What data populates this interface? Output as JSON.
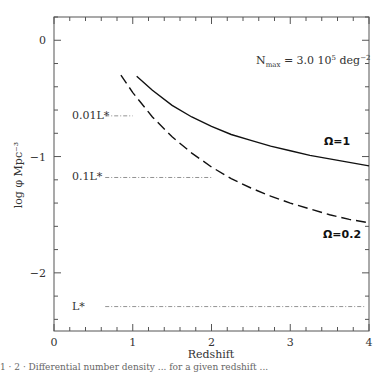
{
  "chart_data": {
    "type": "line",
    "title": "",
    "xlabel": "Redshift",
    "ylabel": "log φ  Mpc⁻³",
    "xlim": [
      0,
      4
    ],
    "ylim": [
      -2.5,
      0.2
    ],
    "x_ticks": [
      0,
      1,
      2,
      3,
      4
    ],
    "x_tick_labels": [
      "0",
      "1",
      "2",
      "3",
      "4"
    ],
    "y_ticks": [
      0,
      -1,
      -2
    ],
    "y_tick_labels": [
      "0",
      "−1",
      "−2"
    ],
    "grid": false,
    "legend": null,
    "annotation": "N_max = 3.0 10⁵ deg⁻²",
    "series": [
      {
        "name": "Ω=1",
        "style": "solid",
        "x": [
          1.05,
          1.25,
          1.5,
          1.75,
          2.0,
          2.25,
          2.5,
          2.75,
          3.0,
          3.25,
          3.5,
          3.75,
          4.0
        ],
        "y": [
          -0.31,
          -0.43,
          -0.56,
          -0.66,
          -0.74,
          -0.81,
          -0.86,
          -0.91,
          -0.95,
          -0.99,
          -1.02,
          -1.05,
          -1.08
        ]
      },
      {
        "name": "Ω=0.2",
        "style": "dashed",
        "x": [
          0.85,
          1.0,
          1.25,
          1.5,
          1.75,
          2.0,
          2.25,
          2.5,
          2.75,
          3.0,
          3.25,
          3.5,
          3.75,
          4.0
        ],
        "y": [
          -0.3,
          -0.45,
          -0.66,
          -0.83,
          -0.97,
          -1.09,
          -1.19,
          -1.27,
          -1.34,
          -1.4,
          -1.45,
          -1.5,
          -1.54,
          -1.57
        ]
      }
    ],
    "reference_lines": [
      {
        "label": "0.01L*",
        "y": -0.65,
        "x_range": [
          0.65,
          1.0
        ],
        "style": "dash-dot"
      },
      {
        "label": "0.1L*",
        "y": -1.18,
        "x_range": [
          0.65,
          2.0
        ],
        "style": "dash-dot"
      },
      {
        "label": "L*",
        "y": -2.29,
        "x_range": [
          0.65,
          3.95
        ],
        "style": "dash-dot"
      }
    ]
  },
  "texts": {
    "annotation_n": "N",
    "annotation_sub": "max",
    "annotation_rest": " =  3.0  10",
    "annotation_exp5": "5",
    "annotation_deg": " deg",
    "annotation_expm2": "−2",
    "caption": "1 · 2 · Differential number density ... for a given redshift ..."
  }
}
